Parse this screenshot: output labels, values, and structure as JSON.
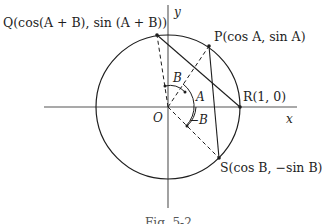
{
  "figure": {
    "type": "unit-circle-angle-addition",
    "caption": "Fig. 5-2",
    "axes": {
      "x_label": "x",
      "y_label": "y"
    },
    "origin": {
      "label": "O"
    },
    "points": {
      "Q": {
        "label": "Q(cos(A + B), sin (A + B))"
      },
      "P": {
        "label": "P(cos A, sin A)"
      },
      "R": {
        "label": "R(1, 0)"
      },
      "S": {
        "label": "S(cos B, −sin B)"
      }
    },
    "angles": {
      "A": "A",
      "B": "B",
      "negB": "−B"
    },
    "segments": [
      {
        "from": "O",
        "to": "Q",
        "style": "dashed"
      },
      {
        "from": "O",
        "to": "P",
        "style": "dashed"
      },
      {
        "from": "O",
        "to": "S",
        "style": "dashed"
      },
      {
        "from": "Q",
        "to": "R",
        "style": "solid"
      },
      {
        "from": "P",
        "to": "S",
        "style": "solid"
      }
    ],
    "colors": {
      "ink": "#1e1e1e",
      "axis": "#555555"
    }
  }
}
